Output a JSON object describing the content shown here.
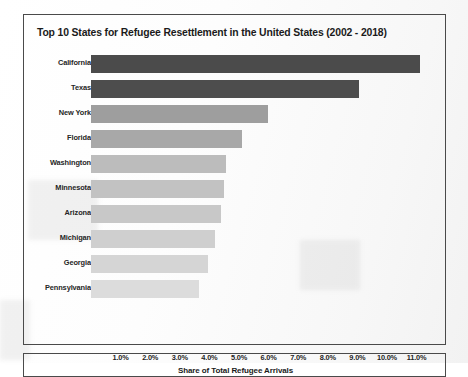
{
  "chart_data": {
    "type": "bar",
    "orientation": "horizontal",
    "title": "Top 10 States for Refugee Resettlement in the United States (2002 - 2018)",
    "xlabel": "Share of Total Refugee Arrivals",
    "ylabel": "",
    "categories": [
      "California",
      "Texas",
      "New York",
      "Florida",
      "Washington",
      "Minnesota",
      "Arizona",
      "Michigan",
      "Georgia",
      "Pennsylvania"
    ],
    "values": [
      11.1,
      9.05,
      5.98,
      5.1,
      4.55,
      4.5,
      4.4,
      4.2,
      3.95,
      3.65
    ],
    "value_format": "percent",
    "xlim": [
      0,
      11.6
    ],
    "xticks": [
      1.0,
      2.0,
      3.0,
      4.0,
      5.0,
      6.0,
      7.0,
      8.0,
      9.0,
      10.0,
      11.0
    ],
    "xtick_labels": [
      "1.0%",
      "2.0%",
      "3.0%",
      "4.0%",
      "5.0%",
      "6.0%",
      "7.0%",
      "8.0%",
      "9.0%",
      "10.0%",
      "11.0%"
    ],
    "grid": false,
    "legend": null,
    "bar_colors": [
      "#4b4b4b",
      "#4d4d4d",
      "#9e9e9e",
      "#a8a8a8",
      "#bcbcbc",
      "#c2c2c2",
      "#c8c8c8",
      "#cfcfcf",
      "#d5d5d5",
      "#dcdcdc"
    ]
  },
  "colors": {
    "panel_border": "#4a4a4a",
    "text": "#1b1b1b",
    "background": "#ffffff"
  }
}
